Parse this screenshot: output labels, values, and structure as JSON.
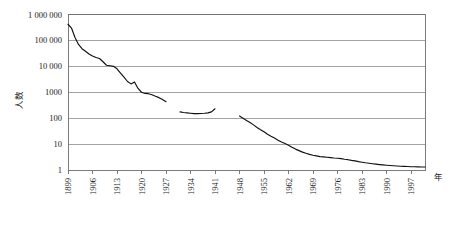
{
  "chart_data": {
    "type": "line",
    "title": "",
    "subtitle": "",
    "xlabel": "年",
    "ylabel": "人数",
    "yscale": "log",
    "ylim": [
      1,
      1000000
    ],
    "xlim": [
      1899,
      2001
    ],
    "grid": true,
    "legend": false,
    "legend_position": "none",
    "y_ticks": [
      1,
      10,
      100,
      1000,
      10000,
      100000,
      1000000
    ],
    "y_tick_labels": [
      "1",
      "10",
      "100",
      "1000",
      "10 000",
      "100 000",
      "1 000 000"
    ],
    "x_ticks": [
      1899,
      1906,
      1913,
      1920,
      1927,
      1934,
      1941,
      1948,
      1955,
      1962,
      1969,
      1976,
      1983,
      1990,
      1997
    ],
    "x_tick_labels": [
      "1899",
      "1906",
      "1913",
      "1920",
      "1927",
      "1934",
      "1941",
      "1948",
      "1955",
      "1962",
      "1969",
      "1976",
      "1983",
      "1990",
      "1997"
    ],
    "series": [
      {
        "name": "人数",
        "color": "#111111",
        "segments": [
          {
            "name": "segment-1",
            "x": [
              1899,
              1900,
              1901,
              1902,
              1903,
              1904,
              1905,
              1906,
              1907,
              1908,
              1909,
              1910,
              1911,
              1912,
              1913,
              1914,
              1915,
              1916,
              1917,
              1918,
              1919,
              1920,
              1921,
              1922,
              1923,
              1924,
              1925,
              1926,
              1927
            ],
            "y": [
              420000,
              300000,
              130000,
              70000,
              48000,
              38000,
              30000,
              25000,
              22000,
              20000,
              15000,
              11000,
              10500,
              10000,
              8000,
              5500,
              3800,
              2600,
              2100,
              2500,
              1400,
              1000,
              900,
              880,
              800,
              700,
              620,
              520,
              430
            ]
          },
          {
            "name": "segment-2",
            "x": [
              1931,
              1932,
              1933,
              1934,
              1935,
              1936,
              1937,
              1938,
              1939,
              1940,
              1941
            ],
            "y": [
              175,
              165,
              160,
              155,
              150,
              150,
              152,
              155,
              160,
              175,
              230
            ]
          },
          {
            "name": "segment-3",
            "x": [
              1948,
              1949,
              1950,
              1951,
              1952,
              1953,
              1954,
              1955,
              1956,
              1957,
              1958,
              1959,
              1960,
              1961,
              1962,
              1963,
              1964,
              1965,
              1966,
              1967,
              1968,
              1969,
              1970,
              1971,
              1972,
              1973,
              1974,
              1975,
              1976,
              1977,
              1978,
              1979,
              1980,
              1981,
              1982,
              1983,
              1984,
              1985,
              1986,
              1987,
              1988,
              1989,
              1990,
              1991,
              1992,
              1993,
              1994,
              1995,
              1996,
              1997,
              1998,
              1999,
              2000,
              2001
            ],
            "y": [
              120,
              100,
              82,
              68,
              55,
              44,
              36,
              30,
              24,
              20,
              17,
              14,
              12,
              10.5,
              9,
              7.5,
              6.4,
              5.6,
              4.9,
              4.4,
              4.0,
              3.7,
              3.5,
              3.3,
              3.2,
              3.1,
              3.0,
              2.9,
              2.85,
              2.75,
              2.6,
              2.5,
              2.35,
              2.25,
              2.1,
              2.0,
              1.9,
              1.82,
              1.75,
              1.68,
              1.62,
              1.57,
              1.53,
              1.49,
              1.46,
              1.43,
              1.4,
              1.38,
              1.36,
              1.34,
              1.33,
              1.32,
              1.31,
              1.3
            ]
          }
        ]
      }
    ]
  }
}
